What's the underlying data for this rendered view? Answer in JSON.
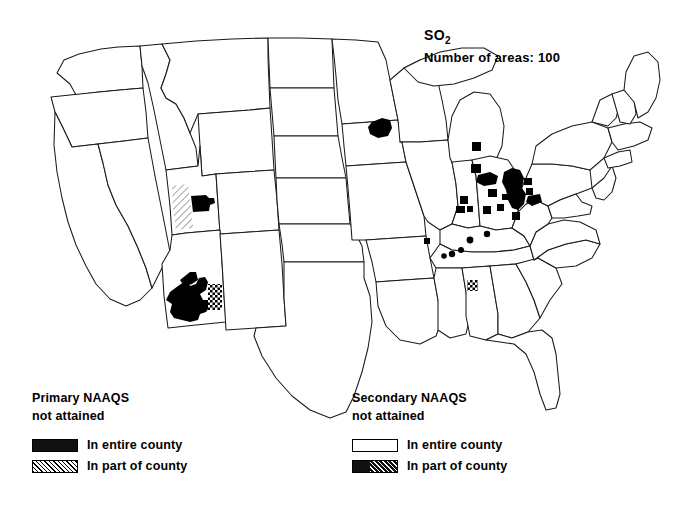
{
  "title": {
    "pollutant": "SO",
    "pollutant_subscript": "2",
    "area_count_line": "Number of areas: 100"
  },
  "legends": {
    "primary": {
      "heading_line1": "Primary NAAQS",
      "heading_line2": "not attained",
      "rows": [
        {
          "swatch": "solid-black",
          "label": "In entire county"
        },
        {
          "swatch": "diagonal-hatch",
          "label": "In part of county"
        }
      ]
    },
    "secondary": {
      "heading_line1": "Secondary NAAQS",
      "heading_line2": "not attained",
      "rows": [
        {
          "swatch": "white-outline",
          "label": "In entire county"
        },
        {
          "swatch": "black-with-hatch",
          "label": "In part of county"
        }
      ]
    }
  },
  "map": {
    "name": "contiguous-united-states",
    "outline_color": "#1a1a1a",
    "fill_color": "#ffffff",
    "marker_color": "#000000",
    "nonattainment_regions": [
      {
        "state": "Utah",
        "type": "in-part-of-county",
        "note": "western Utah hatched band"
      },
      {
        "state": "Utah",
        "type": "in-entire-county",
        "note": "Salt Lake City area solid block"
      },
      {
        "state": "Arizona",
        "type": "in-entire-county",
        "note": "large southern Arizona solid region"
      },
      {
        "state": "Arizona",
        "type": "in-part-of-county",
        "note": "eastern edge checkered patch"
      },
      {
        "state": "Minnesota",
        "type": "in-entire-county",
        "note": "southeastern Minnesota solid blob"
      },
      {
        "state": "Michigan",
        "type": "in-entire-county",
        "note": "two squares lower peninsula"
      },
      {
        "state": "Ohio",
        "type": "in-entire-county",
        "note": "multiple county squares"
      },
      {
        "state": "Indiana",
        "type": "in-entire-county",
        "note": "county squares"
      },
      {
        "state": "Pennsylvania",
        "type": "in-entire-county",
        "note": "western Pennsylvania cluster"
      },
      {
        "state": "West Virginia",
        "type": "in-entire-county",
        "note": "northern panhandle cluster"
      },
      {
        "state": "Tennessee",
        "type": "in-entire-county",
        "note": "small dots"
      },
      {
        "state": "Kentucky",
        "type": "in-entire-county",
        "note": "small dots"
      },
      {
        "state": "Missouri",
        "type": "in-entire-county",
        "note": "small dot"
      },
      {
        "state": "Alabama",
        "type": "in-part-of-county",
        "note": "northern Alabama hatched patch"
      }
    ]
  }
}
